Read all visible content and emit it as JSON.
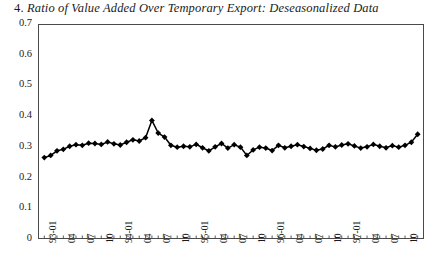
{
  "figure": {
    "number_label": "4.",
    "title_text": "Ratio of Value Added Over Temporary Export: Deseasonalized Data",
    "full_title": "4. Ratio of Value Added Over Temporary Export: Deseasonalized Data",
    "frame_color": "#4a4a4a",
    "marker_color": "#000000",
    "line_color": "#000000",
    "background_color": "#ffffff"
  },
  "axes": {
    "y_ticks": [
      "0.7",
      "0.6",
      "0.5",
      "0.4",
      "0.3",
      "0.2",
      "0.1",
      "0"
    ],
    "x_tick_labels": [
      "93-01",
      "04",
      "07",
      "10",
      "94-01",
      "04",
      "07",
      "10",
      "95-01",
      "04",
      "07",
      "10",
      "96-01",
      "04",
      "07",
      "10",
      "97-01",
      "04",
      "07",
      "10"
    ]
  },
  "chart_data": {
    "type": "line",
    "title": "4. Ratio of Value Added Over Temporary Export: Deseasonalized Data",
    "xlabel": "",
    "ylabel": "",
    "ylim": [
      0,
      0.7
    ],
    "yticks": [
      0,
      0.1,
      0.2,
      0.3,
      0.4,
      0.5,
      0.6,
      0.7
    ],
    "grid": false,
    "legend": "none",
    "markers": "filled-diamond",
    "x_tick_labels": [
      "93-01",
      "04",
      "07",
      "10",
      "94-01",
      "04",
      "07",
      "10",
      "95-01",
      "04",
      "07",
      "10",
      "96-01",
      "04",
      "07",
      "10",
      "97-01",
      "04",
      "07",
      "10"
    ],
    "x_tick_interval_months": 3,
    "x": [
      "1993-01",
      "1993-02",
      "1993-03",
      "1993-04",
      "1993-05",
      "1993-06",
      "1993-07",
      "1993-08",
      "1993-09",
      "1993-10",
      "1993-11",
      "1993-12",
      "1994-01",
      "1994-02",
      "1994-03",
      "1994-04",
      "1994-05",
      "1994-06",
      "1994-07",
      "1994-08",
      "1994-09",
      "1994-10",
      "1994-11",
      "1994-12",
      "1995-01",
      "1995-02",
      "1995-03",
      "1995-04",
      "1995-05",
      "1995-06",
      "1995-07",
      "1995-08",
      "1995-09",
      "1995-10",
      "1995-11",
      "1995-12",
      "1996-01",
      "1996-02",
      "1996-03",
      "1996-04",
      "1996-05",
      "1996-06",
      "1996-07",
      "1996-08",
      "1996-09",
      "1996-10",
      "1996-11",
      "1996-12",
      "1997-01",
      "1997-02",
      "1997-03",
      "1997-04",
      "1997-05",
      "1997-06",
      "1997-07",
      "1997-08",
      "1997-09",
      "1997-10",
      "1997-11",
      "1997-12"
    ],
    "values": [
      0.265,
      0.272,
      0.287,
      0.292,
      0.302,
      0.307,
      0.305,
      0.312,
      0.311,
      0.308,
      0.316,
      0.31,
      0.306,
      0.315,
      0.323,
      0.319,
      0.33,
      0.386,
      0.345,
      0.332,
      0.305,
      0.299,
      0.302,
      0.3,
      0.308,
      0.297,
      0.287,
      0.3,
      0.311,
      0.296,
      0.307,
      0.299,
      0.272,
      0.29,
      0.299,
      0.296,
      0.288,
      0.305,
      0.297,
      0.302,
      0.307,
      0.301,
      0.295,
      0.289,
      0.293,
      0.305,
      0.3,
      0.306,
      0.31,
      0.303,
      0.296,
      0.3,
      0.308,
      0.302,
      0.297,
      0.304,
      0.299,
      0.305,
      0.315,
      0.341
    ]
  }
}
